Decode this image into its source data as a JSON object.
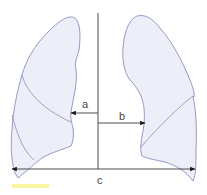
{
  "diagram": {
    "type": "lung-measurement-schematic",
    "labels": {
      "a": "a",
      "b": "b",
      "c": "c"
    },
    "measurements": [
      {
        "id": "a",
        "description": "midline to right-heart border of left-side lung (arrow pointing left)"
      },
      {
        "id": "b",
        "description": "midline to left-heart border of right-side lung (arrow pointing right)"
      },
      {
        "id": "c",
        "description": "maximum internal thoracic width (double-headed arrow)"
      }
    ],
    "colors": {
      "lung_fill": "#eceef8",
      "lung_outline": "#8e8cc0",
      "arrow": "#1a1a1a",
      "label": "#444444",
      "highlight": "#fbf6a0"
    }
  }
}
